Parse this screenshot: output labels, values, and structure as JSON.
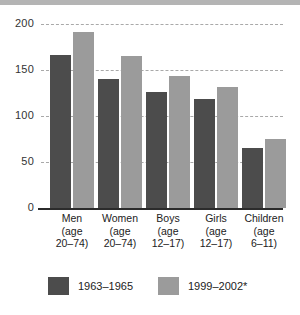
{
  "chart_data": {
    "type": "bar",
    "title": "",
    "subtitle": "",
    "xlabel": "",
    "ylabel": "",
    "ylim": [
      0,
      200
    ],
    "yticks": [
      0,
      50,
      100,
      150,
      200
    ],
    "ytick_labels": [
      "0",
      "50",
      "100",
      "150",
      "200"
    ],
    "grid": true,
    "grid_style": "dashed horizontal",
    "legend_position": "bottom",
    "categories": [
      "Men\n(age\n20–74)",
      "Women\n(age\n20–74)",
      "Boys\n(age\n12–17)",
      "Girls\n(age\n12–17)",
      "Children\n(age\n6–11)"
    ],
    "category_lines": [
      [
        "Men",
        "(age",
        "20–74)"
      ],
      [
        "Women",
        "(age",
        "20–74)"
      ],
      [
        "Boys",
        "(age",
        "12–17)"
      ],
      [
        "Girls",
        "(age",
        "12–17)"
      ],
      [
        "Children",
        "(age",
        "6–11)"
      ]
    ],
    "series": [
      {
        "name": "1963–1965",
        "color": "#4c4c4c",
        "values": [
          166,
          140,
          126,
          119,
          65
        ]
      },
      {
        "name": "1999–2002*",
        "color": "#9b9b9b",
        "values": [
          191,
          165,
          143,
          131,
          75
        ]
      }
    ]
  },
  "legend": {
    "items": [
      {
        "label": "1963–1965",
        "color": "#4c4c4c"
      },
      {
        "label": "1999–2002*",
        "color": "#9b9b9b"
      }
    ]
  },
  "colors": {
    "series_dark": "#4c4c4c",
    "series_light": "#9b9b9b",
    "gridline": "#a9a9a9",
    "axis": "#2b2b2b",
    "top_band": "#b4b4b4",
    "background": "#ffffff"
  }
}
